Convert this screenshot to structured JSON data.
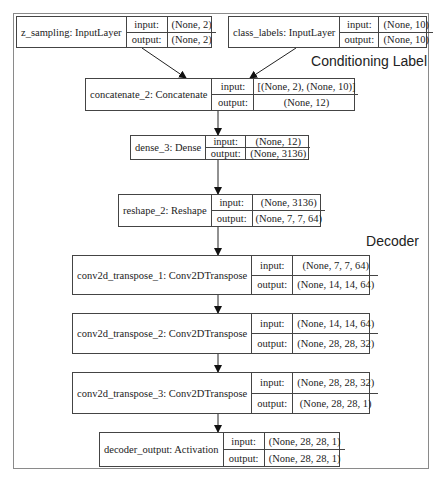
{
  "groups": {
    "conditioning_label": "Conditioning Label",
    "decoder": "Decoder"
  },
  "layers": [
    {
      "name": "z_sampling: InputLayer",
      "input_key": "input:",
      "input": "(None, 2)",
      "output_key": "output:",
      "output": "(None, 2)"
    },
    {
      "name": "class_labels: InputLayer",
      "input_key": "input:",
      "input": "(None, 10)",
      "output_key": "output:",
      "output": "(None, 10)"
    },
    {
      "name": "concatenate_2: Concatenate",
      "input_key": "input:",
      "input": "[(None, 2), (None, 10)]",
      "output_key": "output:",
      "output": "(None, 12)"
    },
    {
      "name": "dense_3: Dense",
      "input_key": "input:",
      "input": "(None, 12)",
      "output_key": "output:",
      "output": "(None, 3136)"
    },
    {
      "name": "reshape_2: Reshape",
      "input_key": "input:",
      "input": "(None, 3136)",
      "output_key": "output:",
      "output": "(None, 7, 7, 64)"
    },
    {
      "name": "conv2d_transpose_1: Conv2DTranspose",
      "input_key": "input:",
      "input": "(None, 7, 7, 64)",
      "output_key": "output:",
      "output": "(None, 14, 14, 64)"
    },
    {
      "name": "conv2d_transpose_2: Conv2DTranspose",
      "input_key": "input:",
      "input": "(None, 14, 14, 64)",
      "output_key": "output:",
      "output": "(None, 28, 28, 32)"
    },
    {
      "name": "conv2d_transpose_3: Conv2DTranspose",
      "input_key": "input:",
      "input": "(None, 28, 28, 32)",
      "output_key": "output:",
      "output": "(None, 28, 28, 1)"
    },
    {
      "name": "decoder_output: Activation",
      "input_key": "input:",
      "input": "(None, 28, 28, 1)",
      "output_key": "output:",
      "output": "(None, 28, 28, 1)"
    }
  ],
  "edges": [
    {
      "from": "z_sampling",
      "to": "concatenate_2"
    },
    {
      "from": "class_labels",
      "to": "concatenate_2"
    },
    {
      "from": "concatenate_2",
      "to": "dense_3"
    },
    {
      "from": "dense_3",
      "to": "reshape_2"
    },
    {
      "from": "reshape_2",
      "to": "conv2d_transpose_1"
    },
    {
      "from": "conv2d_transpose_1",
      "to": "conv2d_transpose_2"
    },
    {
      "from": "conv2d_transpose_2",
      "to": "conv2d_transpose_3"
    },
    {
      "from": "conv2d_transpose_3",
      "to": "decoder_output"
    }
  ]
}
